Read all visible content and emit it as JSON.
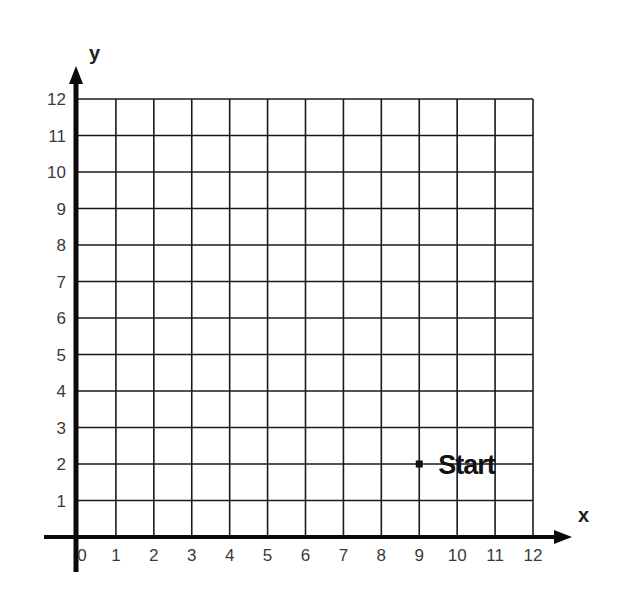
{
  "chart_data": {
    "type": "scatter",
    "title": "",
    "xlabel": "x",
    "ylabel": "y",
    "xlim": [
      0,
      12
    ],
    "ylim": [
      0,
      12
    ],
    "grid": true,
    "x_ticks": [
      "0",
      "1",
      "2",
      "3",
      "4",
      "5",
      "6",
      "7",
      "8",
      "9",
      "10",
      "11",
      "12"
    ],
    "y_ticks": [
      "1",
      "2",
      "3",
      "4",
      "5",
      "6",
      "7",
      "8",
      "9",
      "10",
      "11",
      "12"
    ],
    "points": [
      {
        "label": "Start",
        "x": 9,
        "y": 2
      }
    ]
  },
  "colors": {
    "grid": "#1a1a1a",
    "axis": "#0a0a0a",
    "tick_text": "#3a3a3a",
    "point": "#111111"
  }
}
